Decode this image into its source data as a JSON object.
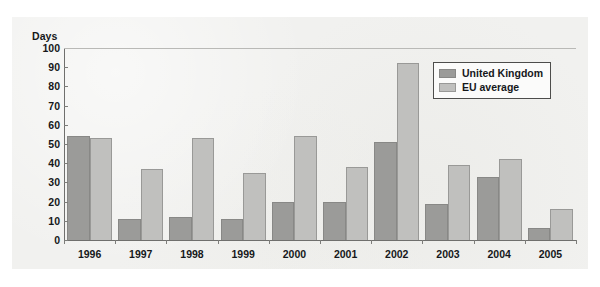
{
  "chart_data": {
    "type": "bar",
    "title": "",
    "subtitle": "",
    "xlabel": "",
    "ylabel": "Days",
    "ylim": [
      0,
      100
    ],
    "yticks": [
      0,
      10,
      20,
      30,
      40,
      50,
      60,
      70,
      80,
      90,
      100
    ],
    "grid": false,
    "legend_position": "top-right",
    "categories": [
      "1996",
      "1997",
      "1998",
      "1999",
      "2000",
      "2001",
      "2002",
      "2003",
      "2004",
      "2005"
    ],
    "series": [
      {
        "name": "United Kingdom",
        "color": "#9b9b99",
        "values": [
          54,
          11,
          12,
          11,
          20,
          20,
          51,
          19,
          33,
          6
        ]
      },
      {
        "name": "EU average",
        "color": "#c0c0be",
        "values": [
          53,
          37,
          53,
          35,
          54,
          38,
          92,
          39,
          42,
          16
        ]
      }
    ]
  },
  "colors": {
    "series_uk": "#9b9b99",
    "series_eu": "#c0c0be",
    "axis": "#6f6f6d",
    "plot_background": "#f1f1ef",
    "text": "#16181a"
  }
}
